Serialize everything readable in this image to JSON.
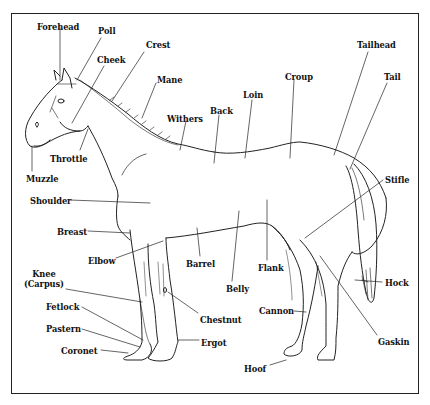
{
  "diagram": {
    "colors": {
      "line": "#222222",
      "text": "#111111",
      "background": "#ffffff"
    },
    "labels": [
      {
        "id": "forehead",
        "text": "Forehead",
        "x": 37,
        "y": 22
      },
      {
        "id": "poll",
        "text": "Poll",
        "x": 98,
        "y": 26
      },
      {
        "id": "crest",
        "text": "Crest",
        "x": 146,
        "y": 40
      },
      {
        "id": "cheek",
        "text": "Cheek",
        "x": 97,
        "y": 55
      },
      {
        "id": "mane",
        "text": "Mane",
        "x": 157,
        "y": 75
      },
      {
        "id": "withers",
        "text": "Withers",
        "x": 167,
        "y": 114
      },
      {
        "id": "back",
        "text": "Back",
        "x": 210,
        "y": 106
      },
      {
        "id": "loin",
        "text": "Loin",
        "x": 243,
        "y": 90
      },
      {
        "id": "croup",
        "text": "Croup",
        "x": 285,
        "y": 72
      },
      {
        "id": "tailhead",
        "text": "Tailhead",
        "x": 357,
        "y": 40
      },
      {
        "id": "tail",
        "text": "Tail",
        "x": 384,
        "y": 72
      },
      {
        "id": "throttle",
        "text": "Throttle",
        "x": 50,
        "y": 154
      },
      {
        "id": "muzzle",
        "text": "Muzzle",
        "x": 26,
        "y": 174
      },
      {
        "id": "stifle",
        "text": "Stifle",
        "x": 385,
        "y": 175
      },
      {
        "id": "shoulder",
        "text": "Shoulder",
        "x": 30,
        "y": 196
      },
      {
        "id": "breast",
        "text": "Breast",
        "x": 57,
        "y": 227
      },
      {
        "id": "elbow",
        "text": "Elbow",
        "x": 88,
        "y": 256
      },
      {
        "id": "barrel",
        "text": "Barrel",
        "x": 186,
        "y": 259
      },
      {
        "id": "flank",
        "text": "Flank",
        "x": 258,
        "y": 263
      },
      {
        "id": "belly",
        "text": "Belly",
        "x": 226,
        "y": 284
      },
      {
        "id": "knee",
        "text": "Knee\n(Carpus)",
        "x": 24,
        "y": 269
      },
      {
        "id": "hock",
        "text": "Hock",
        "x": 385,
        "y": 278
      },
      {
        "id": "chestnut",
        "text": "Chestnut",
        "x": 200,
        "y": 315
      },
      {
        "id": "cannon",
        "text": "Cannon",
        "x": 259,
        "y": 306
      },
      {
        "id": "fetlock",
        "text": "Fetlock",
        "x": 46,
        "y": 302
      },
      {
        "id": "pastern",
        "text": "Pastern",
        "x": 46,
        "y": 324
      },
      {
        "id": "ergot",
        "text": "Ergot",
        "x": 201,
        "y": 338
      },
      {
        "id": "gaskin",
        "text": "Gaskin",
        "x": 378,
        "y": 337
      },
      {
        "id": "coronet",
        "text": "Coronet",
        "x": 61,
        "y": 346
      },
      {
        "id": "hoof",
        "text": "Hoof",
        "x": 244,
        "y": 364
      }
    ]
  }
}
